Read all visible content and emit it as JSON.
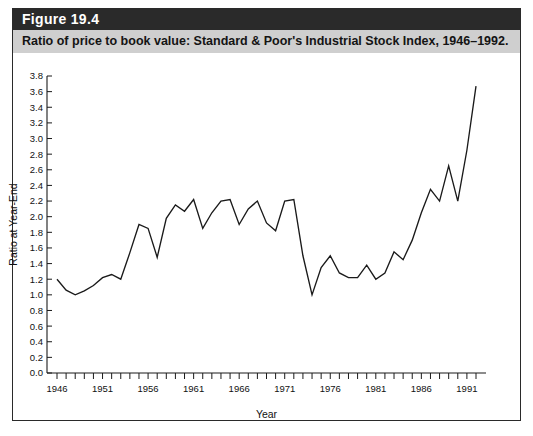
{
  "figure": {
    "number_label": "Figure 19.4",
    "caption": "Ratio of price to book value: Standard & Poor's Industrial Stock Index, 1946–1992."
  },
  "colors": {
    "header_band": "#2a2a2a",
    "caption_band": "#cfcfcf",
    "frame": "#2a2a2a",
    "line": "#1a1a1a",
    "background": "#ffffff"
  },
  "chart_data": {
    "type": "line",
    "title": "Ratio of price to book value: Standard & Poor's Industrial Stock Index, 1946–1992.",
    "xlabel": "Year",
    "ylabel": "Ratio at Year-End",
    "xlim": [
      1945.4,
      1992.6
    ],
    "ylim": [
      0.0,
      3.8
    ],
    "grid": false,
    "legend": null,
    "y_ticks": [
      0.0,
      0.2,
      0.4,
      0.6,
      0.8,
      1.0,
      1.2,
      1.4,
      1.6,
      1.8,
      2.0,
      2.2,
      2.4,
      2.6,
      2.8,
      3.0,
      3.2,
      3.4,
      3.6,
      3.8
    ],
    "y_tick_labels": [
      "0.0",
      "0.2",
      "0.4",
      "0.6",
      "0.8",
      "1.0",
      "1.2",
      "1.4",
      "1.6",
      "1.8",
      "2.0",
      "2.2",
      "2.4",
      "2.6",
      "2.8",
      "3.0",
      "3.2",
      "3.4",
      "3.6",
      "3.8"
    ],
    "x_ticks": [
      1946,
      1947,
      1948,
      1949,
      1950,
      1951,
      1952,
      1953,
      1954,
      1955,
      1956,
      1957,
      1958,
      1959,
      1960,
      1961,
      1962,
      1963,
      1964,
      1965,
      1966,
      1967,
      1968,
      1969,
      1970,
      1971,
      1972,
      1973,
      1974,
      1975,
      1976,
      1977,
      1978,
      1979,
      1980,
      1981,
      1982,
      1983,
      1984,
      1985,
      1986,
      1987,
      1988,
      1989,
      1990,
      1991,
      1992
    ],
    "x_tick_labels_shown": [
      "1946",
      "1951",
      "1956",
      "1961",
      "1966",
      "1971",
      "1976",
      "1981",
      "1986",
      "1991"
    ],
    "x_label_interval": 5,
    "x": [
      1946,
      1947,
      1948,
      1949,
      1950,
      1951,
      1952,
      1953,
      1954,
      1955,
      1956,
      1957,
      1958,
      1959,
      1960,
      1961,
      1962,
      1963,
      1964,
      1965,
      1966,
      1967,
      1968,
      1969,
      1970,
      1971,
      1972,
      1973,
      1974,
      1975,
      1976,
      1977,
      1978,
      1979,
      1980,
      1981,
      1982,
      1983,
      1984,
      1985,
      1986,
      1987,
      1988,
      1989,
      1990,
      1991,
      1992
    ],
    "values": [
      1.2,
      1.06,
      1.0,
      1.05,
      1.12,
      1.22,
      1.26,
      1.2,
      1.54,
      1.9,
      1.85,
      1.48,
      1.98,
      2.15,
      2.07,
      2.22,
      1.85,
      2.05,
      2.2,
      2.22,
      1.9,
      2.1,
      2.2,
      1.92,
      1.82,
      2.2,
      2.22,
      1.5,
      1.0,
      1.35,
      1.5,
      1.28,
      1.22,
      1.22,
      1.38,
      1.2,
      1.28,
      1.55,
      1.45,
      1.7,
      2.05,
      2.35,
      2.2,
      2.65,
      2.2,
      2.85,
      3.67
    ],
    "series": [
      {
        "name": "Price-to-book ratio",
        "values": [
          1.2,
          1.06,
          1.0,
          1.05,
          1.12,
          1.22,
          1.26,
          1.2,
          1.54,
          1.9,
          1.85,
          1.48,
          1.98,
          2.15,
          2.07,
          2.22,
          1.85,
          2.05,
          2.2,
          2.22,
          1.9,
          2.1,
          2.2,
          1.92,
          1.82,
          2.2,
          2.22,
          1.5,
          1.0,
          1.35,
          1.5,
          1.28,
          1.22,
          1.22,
          1.38,
          1.2,
          1.28,
          1.55,
          1.45,
          1.7,
          2.05,
          2.35,
          2.2,
          2.65,
          2.2,
          2.85,
          3.67
        ]
      }
    ]
  }
}
